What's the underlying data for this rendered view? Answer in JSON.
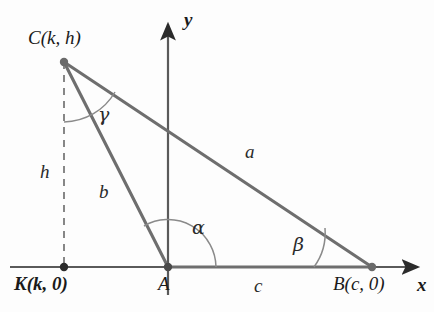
{
  "figure": {
    "type": "geometry-diagram",
    "background_color": "#fdfdfd",
    "line_color": "#6b6b6b",
    "axis_color": "#4a4a4a",
    "text_color": "#1a1a1a"
  },
  "axes": {
    "x_label": "x",
    "y_label": "y",
    "x_axis": {
      "y": 267,
      "x_start": 10,
      "x_end": 425
    },
    "y_axis": {
      "x": 168,
      "y_start": 17,
      "y_end": 295
    }
  },
  "points": [
    {
      "id": "C",
      "label": "C(k, h)",
      "x": 64,
      "y": 62,
      "bold": false,
      "label_x": 28,
      "label_y": 28
    },
    {
      "id": "A",
      "label": "A",
      "x": 168,
      "y": 267,
      "bold": false,
      "label_x": 158,
      "label_y": 274
    },
    {
      "id": "B",
      "label": "B(c, 0)",
      "x": 372,
      "y": 267,
      "bold": false,
      "label_x": 333,
      "label_y": 274
    },
    {
      "id": "K",
      "label": "K(k, 0)",
      "x": 64,
      "y": 267,
      "bold": true,
      "label_x": 14,
      "label_y": 274
    }
  ],
  "sides": [
    {
      "id": "a",
      "label": "a",
      "from": "C",
      "to": "B",
      "label_x": 245,
      "label_y": 142
    },
    {
      "id": "b",
      "label": "b",
      "from": "C",
      "to": "A",
      "label_x": 99,
      "label_y": 182
    },
    {
      "id": "c",
      "label": "c",
      "from": "A",
      "to": "B",
      "label_x": 254,
      "label_y": 276
    }
  ],
  "segments": [
    {
      "id": "h",
      "label": "h",
      "from": "C",
      "to": "K",
      "style": "dashed",
      "label_x": 40,
      "label_y": 162
    }
  ],
  "angles": [
    {
      "id": "gamma",
      "label": "γ",
      "vertex": "C",
      "label_x": 98,
      "label_y": 105
    },
    {
      "id": "alpha",
      "label": "α",
      "vertex": "A",
      "label_x": 192,
      "label_y": 218
    },
    {
      "id": "beta",
      "label": "β",
      "vertex": "B",
      "label_x": 293,
      "label_y": 235
    }
  ]
}
